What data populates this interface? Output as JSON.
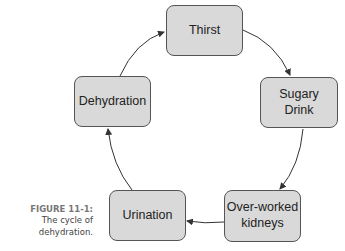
{
  "caption": {
    "label": "FIGURE 11-1:",
    "text_line1": "The cycle of",
    "text_line2": "dehydration."
  },
  "nodes": [
    {
      "id": "thirst",
      "label": "Thirst"
    },
    {
      "id": "sugary-drink",
      "label": "Sugary\nDrink"
    },
    {
      "id": "over-worked-kidneys",
      "label": "Over-worked\nkidneys"
    },
    {
      "id": "urination",
      "label": "Urination"
    },
    {
      "id": "dehydration",
      "label": "Dehydration"
    }
  ],
  "edges": [
    {
      "from": "thirst",
      "to": "sugary-drink"
    },
    {
      "from": "sugary-drink",
      "to": "over-worked-kidneys"
    },
    {
      "from": "over-worked-kidneys",
      "to": "urination"
    },
    {
      "from": "urination",
      "to": "dehydration"
    },
    {
      "from": "dehydration",
      "to": "thirst"
    }
  ],
  "colors": {
    "node_fill": "#d9d9d9",
    "node_border": "#555555",
    "arrow": "#333333"
  }
}
